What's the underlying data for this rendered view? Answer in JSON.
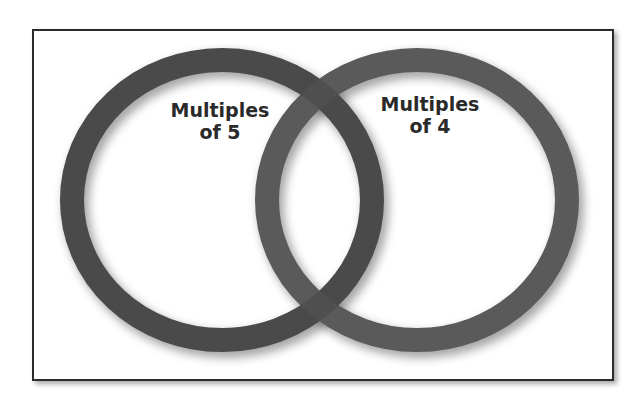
{
  "diagram": {
    "type": "venn",
    "sets": [
      {
        "id": "left",
        "label_line1": "Multiples",
        "label_line2": "of 5"
      },
      {
        "id": "right",
        "label_line1": "Multiples",
        "label_line2": "of 4"
      }
    ],
    "colors": {
      "ring": "#555555",
      "border": "#2b2b2b",
      "background": "#ffffff"
    }
  }
}
